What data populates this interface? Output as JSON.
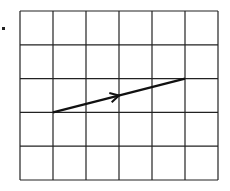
{
  "figure": {
    "bullet_marker": "■",
    "grid": {
      "columns": 6,
      "rows": 5,
      "line_color": "#222222"
    },
    "vector": {
      "start": {
        "col": 1,
        "row": 3
      },
      "end": {
        "col": 5,
        "row": 2
      },
      "color": "#111111",
      "arrowhead_position": "midpoint"
    }
  }
}
